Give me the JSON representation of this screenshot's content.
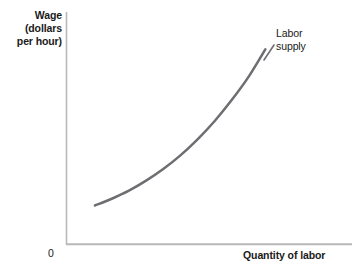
{
  "chart_data": {
    "type": "line",
    "title": "",
    "subtitle": "",
    "xlabel": "Quantity of labor",
    "ylabel": "Wage\n(dollars\nper hour)",
    "ylabel_lines": [
      "Wage",
      "(dollars",
      "per hour)"
    ],
    "origin_label": "0",
    "grid": false,
    "legend_position": "none",
    "axis_arrows": false,
    "xlim": [
      0,
      1
    ],
    "ylim": [
      0,
      1
    ],
    "xticks": [],
    "yticks": [],
    "xticklabels": [],
    "yticklabels": [],
    "series": [
      {
        "name": "Labor supply",
        "annotation": "Labor\nsupply",
        "annotation_lines": [
          "Labor",
          "supply"
        ],
        "color": "#6e6e72",
        "linewidth": 2.5,
        "shape": "convex-increasing",
        "description": "Upward sloping labor supply curve, convex (slope increases with quantity)",
        "points": [
          {
            "x": 0.101,
            "y": 0.167
          },
          {
            "x": 0.16,
            "y": 0.196
          },
          {
            "x": 0.22,
            "y": 0.231
          },
          {
            "x": 0.28,
            "y": 0.274
          },
          {
            "x": 0.34,
            "y": 0.324
          },
          {
            "x": 0.4,
            "y": 0.383
          },
          {
            "x": 0.46,
            "y": 0.452
          },
          {
            "x": 0.52,
            "y": 0.531
          },
          {
            "x": 0.58,
            "y": 0.622
          },
          {
            "x": 0.64,
            "y": 0.724
          },
          {
            "x": 0.697,
            "y": 0.839
          }
        ]
      }
    ],
    "colors": {
      "curve": "#6e6e72",
      "axis": "#b9b9bc",
      "text": "#1a1a1a",
      "background": "#ffffff"
    }
  },
  "figure": {
    "width": 364,
    "height": 277,
    "axes": {
      "y_axis_name": "wage-axis",
      "x_axis_name": "quantity-axis"
    }
  }
}
